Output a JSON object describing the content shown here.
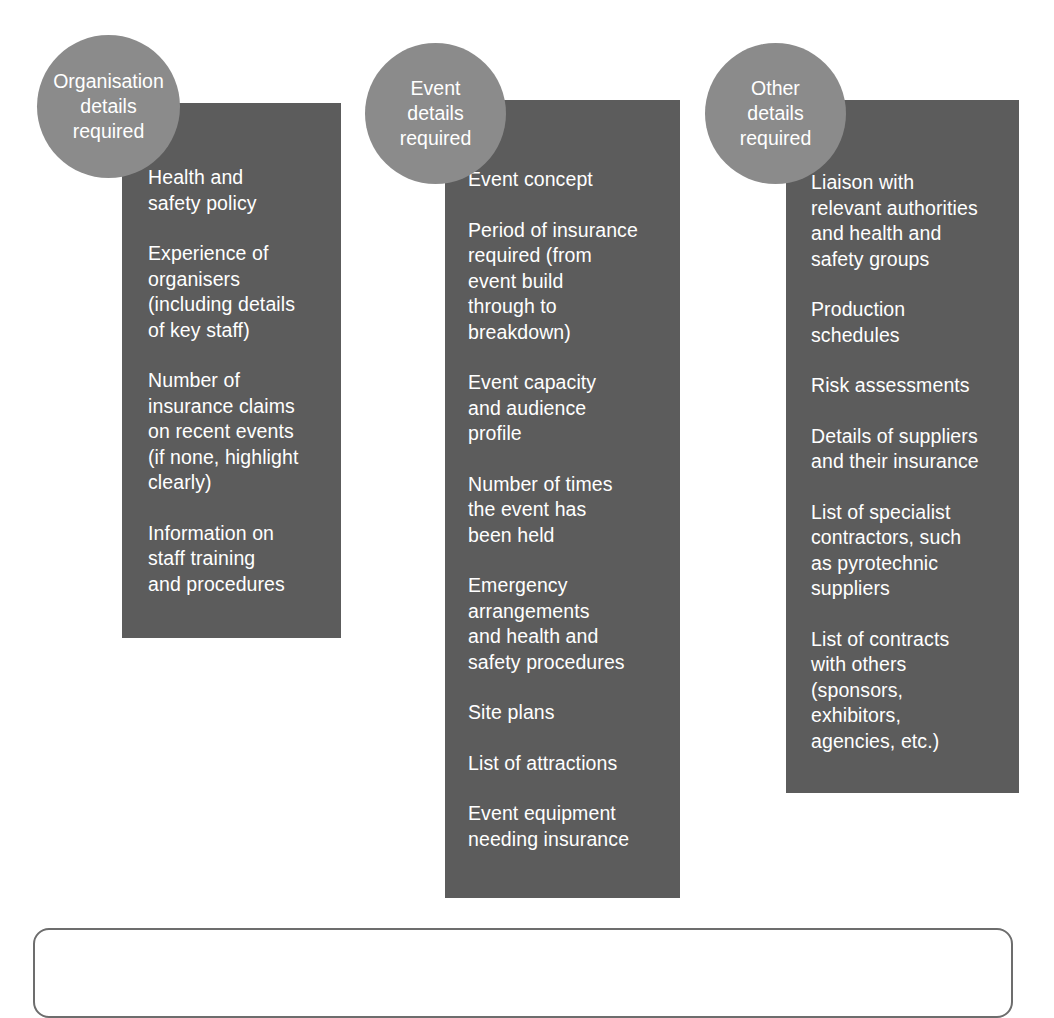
{
  "diagram": {
    "type": "three-column-grouped-list",
    "colors": {
      "panel_fill": "#5c5c5c",
      "badge_fill": "#8b8b8b",
      "text": "#ffffff",
      "frame_border": "#6d6d6d",
      "background": "#ffffff"
    },
    "columns": [
      {
        "badge_label": "Organisation\ndetails\nrequired",
        "items": [
          " Health and\nsafety policy",
          "Experience of\norganisers\n(including details\nof key staff)",
          "Number of\ninsurance claims\non recent events\n(if none, highlight\nclearly)",
          "Information on\nstaff training\nand procedures"
        ]
      },
      {
        "badge_label": "Event\ndetails\nrequired",
        "items": [
          "Event concept",
          "Period of insurance\nrequired (from\nevent build\nthrough to\nbreakdown)",
          "Event capacity\nand audience\nprofile",
          " Number of times\n the event has\n been held",
          "Emergency\narrangements\nand health and\nsafety procedures",
          "Site plans",
          "List of attractions",
          "Event equipment\nneeding insurance"
        ]
      },
      {
        "badge_label": "Other\ndetails\nrequired",
        "items": [
          "Liaison with\nrelevant authorities\nand health and\nsafety groups",
          "Production\nschedules",
          "Risk assessments",
          "Details of suppliers\nand their insurance",
          "List of specialist\ncontractors, such\nas pyrotechnic\nsuppliers",
          "List of contracts\nwith others\n(sponsors,\nexhibitors,\nagencies, etc.)"
        ]
      }
    ],
    "bottom_frame": {
      "label": ""
    }
  }
}
